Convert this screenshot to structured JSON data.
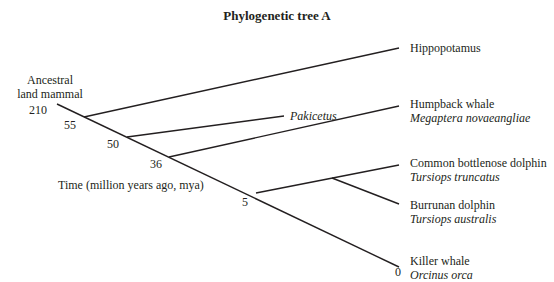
{
  "title": "Phylogenetic tree A",
  "root_label": [
    "Ancestral",
    "land mammal"
  ],
  "time_axis_label": "Time (million years ago, mya)",
  "taxa": [
    {
      "common": "Hippopotamus",
      "scientific": ""
    },
    {
      "common": "",
      "scientific": "Pakicetus"
    },
    {
      "common": "Humpback whale",
      "scientific": "Megaptera novaeangliae"
    },
    {
      "common": "Common bottlenose dolphin",
      "scientific": "Tursiops truncatus"
    },
    {
      "common": "Burrunan dolphin",
      "scientific": "Tursiops australis"
    },
    {
      "common": "Killer whale",
      "scientific": "Orcinus orca"
    }
  ],
  "node_times": {
    "root": "210",
    "n55": "55",
    "n50": "50",
    "n36": "36",
    "n5": "5",
    "present": "0"
  },
  "line_color": "#231f20"
}
